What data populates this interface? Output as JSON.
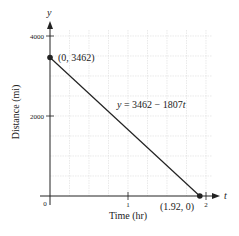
{
  "chart_data": {
    "type": "line",
    "title": "",
    "xlabel": "Time (hr)",
    "ylabel": "Distance (mi)",
    "x_axis_var": "t",
    "y_axis_var": "y",
    "xlim": [
      0,
      2
    ],
    "ylim": [
      0,
      4000
    ],
    "x_ticks": [
      0,
      1,
      2
    ],
    "x_tick_labels": [
      "0",
      "1",
      "2"
    ],
    "y_ticks": [
      2000,
      4000
    ],
    "y_tick_labels": [
      "2000",
      "4000"
    ],
    "grid": true,
    "grid_x_step": 0.25,
    "grid_y_step": 500,
    "series": [
      {
        "name": "y = 3462 − 1807t",
        "x": [
          0,
          1.92
        ],
        "y": [
          3462,
          0
        ],
        "color": "#222222"
      }
    ],
    "points": [
      {
        "x": 0,
        "y": 3462,
        "label": "(0, 3462)"
      },
      {
        "x": 1.92,
        "y": 0,
        "label": "(1.92, 0)"
      }
    ],
    "annotations": [
      {
        "text": "y = 3462 − 1807t",
        "x": 1.2,
        "y": 2300
      }
    ]
  },
  "labels": {
    "y_var": "y",
    "t_var": "t",
    "origin": "0",
    "tick_x1": "1",
    "tick_x2": "2",
    "tick_y2000": "2000",
    "tick_y4000": "4000",
    "xlabel": "Time (hr)",
    "ylabel": "Distance (mi)",
    "point_start": "(0, 3462)",
    "point_end": "(1.92, 0)",
    "equation_lhs": "y",
    "equation_rhs": " = 3462 − 1807",
    "equation_var": "t"
  }
}
